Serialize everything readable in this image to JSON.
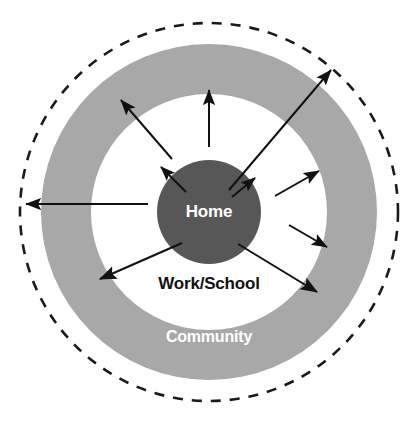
{
  "diagram": {
    "type": "concentric-circles",
    "canvas": {
      "width": 413,
      "height": 427
    },
    "center": {
      "x": 209,
      "y": 212
    },
    "colors": {
      "background": "#ffffff",
      "inner_circle_fill": "#575757",
      "middle_ring_fill": "#ffffff",
      "outer_ring_fill": "#a8a8a8",
      "dashed_stroke": "#1a1a1a",
      "arrow_stroke": "#111111",
      "label_light": "#ffffff",
      "label_dark": "#111111"
    },
    "rings": [
      {
        "name": "inner-circle",
        "label": "Home",
        "label_color": "#ffffff",
        "fill": "#575757",
        "radius": 52,
        "label_x": 209,
        "label_y": 213,
        "font_size": 17
      },
      {
        "name": "middle-ring",
        "label": "Work/School",
        "label_color": "#111111",
        "fill": "#ffffff",
        "radius": 118,
        "label_x": 209,
        "label_y": 285,
        "font_size": 17
      },
      {
        "name": "outer-ring",
        "label": "Community",
        "label_color": "#ffffff",
        "fill": "#a8a8a8",
        "radius": 168,
        "label_x": 209,
        "label_y": 338,
        "font_size": 16
      },
      {
        "name": "dashed-boundary",
        "label": "",
        "label_color": "",
        "fill": "none",
        "radius": 189,
        "label_x": 0,
        "label_y": 0,
        "font_size": 0
      }
    ],
    "dashed_boundary": {
      "radius": 189,
      "stroke_width": 2.6,
      "dash_pattern": "10 9"
    },
    "arrows": [
      {
        "name": "arrow-up",
        "x1": 209,
        "y1": 147,
        "x2": 209,
        "y2": 90,
        "head": 9,
        "width": 2.0
      },
      {
        "name": "arrow-up-left-long",
        "x1": 172,
        "y1": 159,
        "x2": 121,
        "y2": 100,
        "head": 9,
        "width": 2.0
      },
      {
        "name": "arrow-up-left-short",
        "x1": 186,
        "y1": 192,
        "x2": 161,
        "y2": 167,
        "head": 8,
        "width": 2.0
      },
      {
        "name": "arrow-left-long",
        "x1": 148,
        "y1": 204,
        "x2": 26,
        "y2": 204,
        "head": 9,
        "width": 2.0
      },
      {
        "name": "arrow-down-left",
        "x1": 182,
        "y1": 243,
        "x2": 100,
        "y2": 279,
        "head": 10,
        "width": 2.0
      },
      {
        "name": "arrow-up-right-long",
        "x1": 229,
        "y1": 190,
        "x2": 331,
        "y2": 70,
        "head": 9,
        "width": 2.0
      },
      {
        "name": "arrow-up-right-short",
        "x1": 232,
        "y1": 197,
        "x2": 255,
        "y2": 178,
        "head": 8,
        "width": 2.0
      },
      {
        "name": "arrow-right",
        "x1": 275,
        "y1": 196,
        "x2": 319,
        "y2": 171,
        "head": 9,
        "width": 2.0
      },
      {
        "name": "arrow-down-right-mid",
        "x1": 289,
        "y1": 225,
        "x2": 327,
        "y2": 247,
        "head": 9,
        "width": 2.0
      },
      {
        "name": "arrow-down-right-long",
        "x1": 238,
        "y1": 244,
        "x2": 317,
        "y2": 292,
        "head": 10,
        "width": 2.0
      }
    ]
  }
}
